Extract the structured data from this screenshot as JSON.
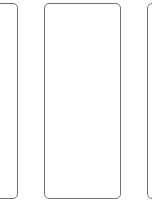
{
  "cards": [
    {
      "position": "left",
      "content": "",
      "partially_visible": true
    },
    {
      "position": "middle",
      "content": "",
      "partially_visible": false
    },
    {
      "position": "right",
      "content": "",
      "partially_visible": true
    }
  ],
  "colors": {
    "background": "#ffffff",
    "card_border": "#6f6f6f"
  }
}
